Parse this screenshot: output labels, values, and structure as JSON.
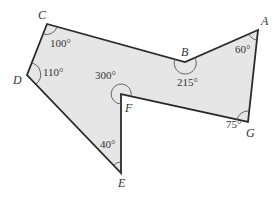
{
  "figure": {
    "fill_color": "#e6e6e6",
    "stroke_color": "#2a2a2a",
    "vertices": [
      {
        "name": "A",
        "angle": "60°"
      },
      {
        "name": "B",
        "angle": "215°"
      },
      {
        "name": "C",
        "angle": "100°"
      },
      {
        "name": "D",
        "angle": "110°"
      },
      {
        "name": "E",
        "angle": "40°"
      },
      {
        "name": "F",
        "angle": "300°"
      },
      {
        "name": "G",
        "angle": "75°"
      }
    ]
  }
}
